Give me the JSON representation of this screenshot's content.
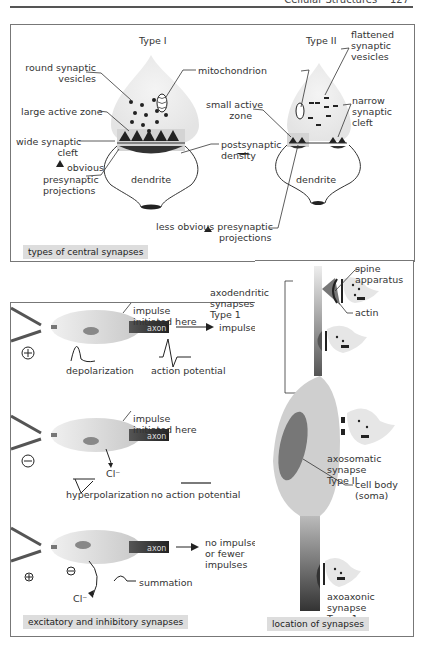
{
  "header": {
    "running_title": "Cellular Structures",
    "page_number": "127"
  },
  "panel_types": {
    "caption": "types of central synapses",
    "type1": {
      "title": "Type I",
      "labels": {
        "round_vesicles_1": "round synaptic",
        "round_vesicles_2": "vesicles",
        "mitochondrion": "mitochondrion",
        "large_active_zone": "large active zone",
        "wide_cleft_1": "wide synaptic",
        "wide_cleft_2": "cleft",
        "postsynaptic_1": "postsynaptic",
        "postsynaptic_2": "density",
        "dendrite": "dendrite",
        "obvious_1": "obvious",
        "obvious_2": "presynaptic",
        "obvious_3": "projections"
      }
    },
    "type2": {
      "title": "Type II",
      "labels": {
        "flattened_1": "flattened",
        "flattened_2": "synaptic",
        "flattened_3": "vesicles",
        "small_active_1": "small active",
        "small_active_2": "zone",
        "narrow_1": "narrow",
        "narrow_2": "synaptic",
        "narrow_3": "cleft",
        "dendrite": "dendrite",
        "less_obvious_1": "less obvious presynaptic",
        "less_obvious_2": "projections"
      }
    }
  },
  "panel_excitatory": {
    "caption": "excitatory and inhibitory synapses",
    "row1": {
      "impulse_1": "impulse",
      "impulse_2": "initiated here",
      "axon": "axon",
      "output": "impulse",
      "wave1": "depolarization",
      "wave2": "action potential",
      "sign": "+"
    },
    "row2": {
      "impulse_1": "impulse",
      "impulse_2": "initiated here",
      "axon": "axon",
      "ion": "Cl⁻",
      "wave1": "hyperpolarization",
      "wave2": "no action potential",
      "sign": "−"
    },
    "row3": {
      "axon": "axon",
      "ion": "Cl⁻",
      "output_1": "no impulse",
      "output_2": "or fewer",
      "output_3": "impulses",
      "wave": "summation",
      "sign_plus": "+",
      "sign_minus": "−"
    }
  },
  "panel_location": {
    "caption": "location of synapses",
    "labels": {
      "spine_1": "spine",
      "spine_2": "apparatus",
      "actin": "actin",
      "axodendritic_1": "axodendritic",
      "axodendritic_2": "synapses",
      "axodendritic_3": "Type 1",
      "axosomatic_1": "axosomatic",
      "axosomatic_2": "synapse",
      "axosomatic_3": "Type II",
      "cell_body_1": "cell body",
      "cell_body_2": "(soma)",
      "axoaxonic_1": "axoaxonic",
      "axoaxonic_2": "synapse",
      "axoaxonic_3": "Type 1"
    }
  },
  "colors": {
    "border": "#777777",
    "caption_bg": "#dddddd",
    "shape_gray": "#cfcfcf",
    "dark": "#222222"
  }
}
